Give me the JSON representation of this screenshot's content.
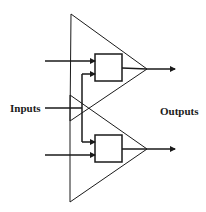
{
  "diagram": {
    "labels": {
      "inputs": "Inputs",
      "outputs": "Outputs"
    },
    "colors": {
      "stroke": "#1a1a1a",
      "background": "#ffffff"
    },
    "triangles": [
      {
        "name": "upper-triangle",
        "points": "71,14 147,69 70,121"
      },
      {
        "name": "lower-triangle",
        "points": "70,95 147,149 70,202"
      }
    ],
    "boxes": [
      {
        "name": "upper-box",
        "x": 95,
        "y": 54,
        "w": 27,
        "h": 27
      },
      {
        "name": "lower-box",
        "x": 95,
        "y": 135,
        "w": 27,
        "h": 27
      }
    ]
  }
}
